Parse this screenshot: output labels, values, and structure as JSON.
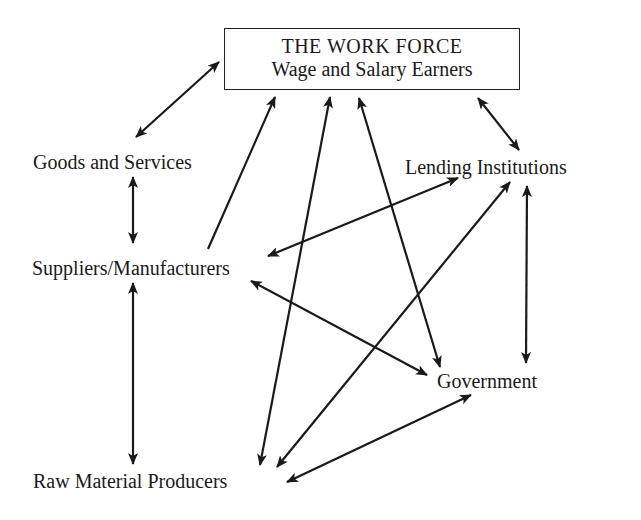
{
  "diagram": {
    "top_box": {
      "title": "THE WORK FORCE",
      "subtitle": "Wage and Salary Earners"
    },
    "nodes": {
      "goods": "Goods and Services",
      "lending": "Lending Institutions",
      "suppliers": "Suppliers/Manufacturers",
      "government": "Government",
      "raw": "Raw Material Producers"
    },
    "edges": [
      {
        "from": "Goods and Services",
        "to": "THE WORK FORCE",
        "type": "bidirectional"
      },
      {
        "from": "THE WORK FORCE",
        "to": "Lending Institutions",
        "type": "bidirectional"
      },
      {
        "from": "Goods and Services",
        "to": "Suppliers/Manufacturers",
        "type": "bidirectional"
      },
      {
        "from": "Suppliers/Manufacturers",
        "to": "THE WORK FORCE",
        "type": "directed"
      },
      {
        "from": "Raw Material Producers",
        "to": "THE WORK FORCE",
        "type": "bidirectional"
      },
      {
        "from": "Government",
        "to": "THE WORK FORCE",
        "type": "bidirectional"
      },
      {
        "from": "Suppliers/Manufacturers",
        "to": "Lending Institutions",
        "type": "bidirectional"
      },
      {
        "from": "Raw Material Producers",
        "to": "Lending Institutions",
        "type": "bidirectional"
      },
      {
        "from": "Lending Institutions",
        "to": "Government",
        "type": "bidirectional"
      },
      {
        "from": "Suppliers/Manufacturers",
        "to": "Government",
        "type": "bidirectional"
      },
      {
        "from": "Suppliers/Manufacturers",
        "to": "Raw Material Producers",
        "type": "bidirectional"
      },
      {
        "from": "Raw Material Producers",
        "to": "Government",
        "type": "bidirectional"
      }
    ]
  }
}
